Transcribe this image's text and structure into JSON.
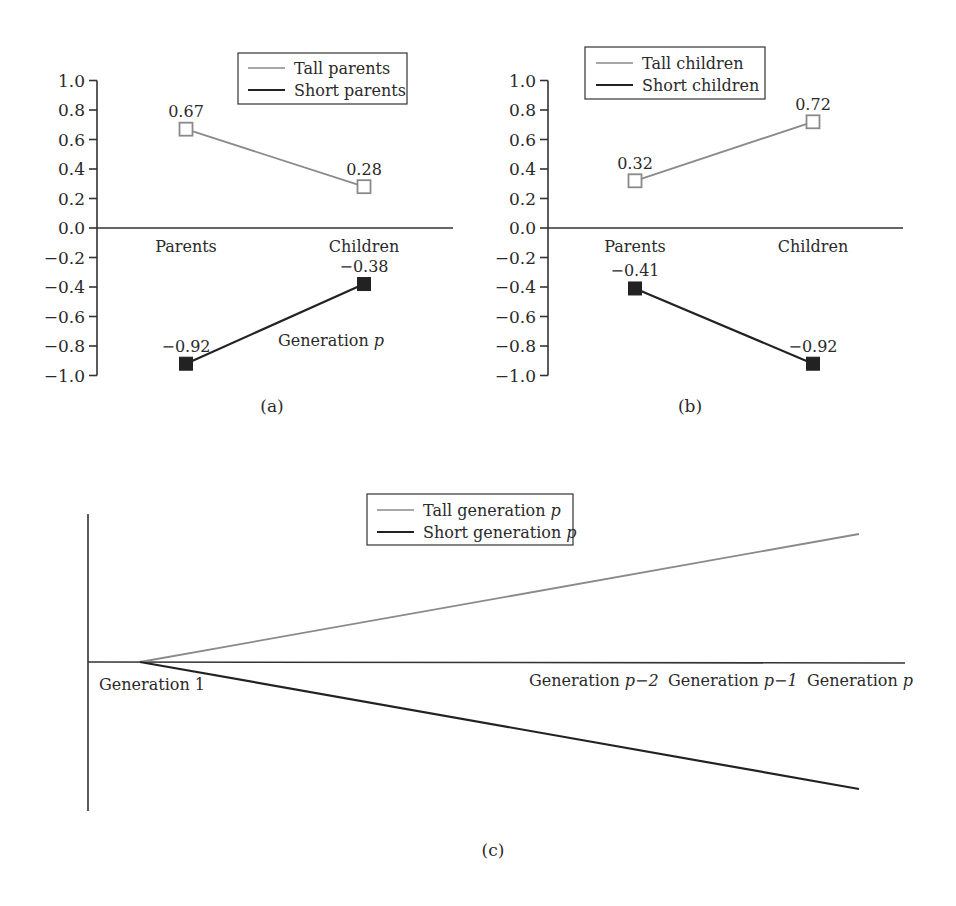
{
  "figure": {
    "panels": [
      "(a)",
      "(b)",
      "(c)"
    ]
  },
  "colors": {
    "tall": "#8a8a8a",
    "short": "#222222",
    "axis": "#333333",
    "text": "#2a2a2a",
    "background": "#ffffff"
  },
  "chart_data": [
    {
      "id": "a",
      "type": "line",
      "caption": "(a)",
      "categories": [
        "Parents",
        "Children"
      ],
      "series": [
        {
          "name": "Tall parents",
          "values": [
            0.67,
            0.28
          ],
          "labels": [
            "0.67",
            "0.28"
          ],
          "marker": "open-square",
          "color": "#8a8a8a"
        },
        {
          "name": "Short parents",
          "values": [
            -0.92,
            -0.38
          ],
          "labels": [
            "−0.92",
            "−0.38"
          ],
          "marker": "filled-square",
          "color": "#222222"
        }
      ],
      "yticks": [
        1.0,
        0.8,
        0.6,
        0.4,
        0.2,
        0.0,
        -0.2,
        -0.4,
        -0.6,
        -0.8,
        -1.0
      ],
      "ytick_labels": [
        "1.0",
        "0.8",
        "0.6",
        "0.4",
        "0.2",
        "0.0",
        "−0.2",
        "−0.4",
        "−0.6",
        "−0.8",
        "−1.0"
      ],
      "ylim": [
        -1.0,
        1.0
      ],
      "annotation": {
        "text": "Generation ",
        "italic": "p"
      },
      "legend_position": "top-right",
      "grid": false,
      "title": "",
      "xlabel": "",
      "ylabel": ""
    },
    {
      "id": "b",
      "type": "line",
      "caption": "(b)",
      "categories": [
        "Parents",
        "Children"
      ],
      "series": [
        {
          "name": "Tall children",
          "values": [
            0.32,
            0.72
          ],
          "labels": [
            "0.32",
            "0.72"
          ],
          "marker": "open-square",
          "color": "#8a8a8a"
        },
        {
          "name": "Short children",
          "values": [
            -0.41,
            -0.92
          ],
          "labels": [
            "−0.41",
            "−0.92"
          ],
          "marker": "filled-square",
          "color": "#222222"
        }
      ],
      "yticks": [
        1.0,
        0.8,
        0.6,
        0.4,
        0.2,
        0.0,
        -0.2,
        -0.4,
        -0.6,
        -0.8,
        -1.0
      ],
      "ytick_labels": [
        "1.0",
        "0.8",
        "0.6",
        "0.4",
        "0.2",
        "0.0",
        "−0.2",
        "−0.4",
        "−0.6",
        "−0.8",
        "−1.0"
      ],
      "ylim": [
        -1.0,
        1.0
      ],
      "legend_position": "top-left",
      "grid": false,
      "title": "",
      "xlabel": "",
      "ylabel": ""
    },
    {
      "id": "c",
      "type": "line",
      "caption": "(c)",
      "schematic": true,
      "x_labels": [
        {
          "text": "Generation 1",
          "italic": ""
        },
        {
          "text": "Generation ",
          "italic": "p−2"
        },
        {
          "text": "Generation ",
          "italic": "p−1"
        },
        {
          "text": "Generation ",
          "italic": "p"
        }
      ],
      "series": [
        {
          "name": "Tall generation ",
          "name_italic": "p",
          "trend": "diverging upward from Generation 1",
          "color": "#8a8a8a"
        },
        {
          "name": "Short generation ",
          "name_italic": "p",
          "trend": "diverging downward from Generation 1",
          "color": "#222222"
        }
      ],
      "legend_position": "top-center",
      "grid": false,
      "yticks": [],
      "title": "",
      "xlabel": "",
      "ylabel": ""
    }
  ]
}
